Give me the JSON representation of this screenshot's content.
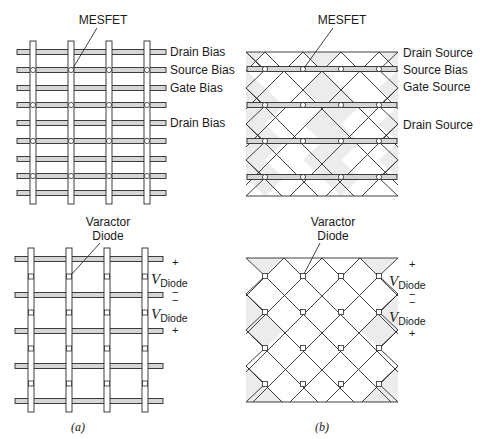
{
  "figure": {
    "panel_a": {
      "caption": "(a)",
      "top": {
        "callout": "MESFET",
        "row_labels": [
          {
            "row": 0,
            "text": "Drain Bias"
          },
          {
            "row": 1,
            "text": "Source Bias"
          },
          {
            "row": 2,
            "text": "Gate Bias"
          },
          {
            "row": 4,
            "text": "Drain Bias"
          }
        ]
      },
      "bottom": {
        "callout_line1": "Varactor",
        "callout_line2": "Diode",
        "polarity": {
          "plus_top": "+",
          "v1": "V",
          "v1_sub": "Diode",
          "minus1": "−",
          "minus2": "−",
          "v2": "V",
          "v2_sub": "Diode",
          "plus_bottom": "+"
        }
      }
    },
    "panel_b": {
      "caption": "(b)",
      "top": {
        "callout": "MESFET",
        "row_labels": [
          {
            "text": "Drain Source"
          },
          {
            "text": "Source Bias"
          },
          {
            "text": "Gate Source"
          },
          {
            "text": "Drain Source"
          }
        ]
      },
      "bottom": {
        "callout_line1": "Varactor",
        "callout_line2": "Diode",
        "polarity": {
          "plus_top": "+",
          "v1": "V",
          "v1_sub": "Diode",
          "minus1": "−",
          "minus2": "−",
          "v2": "V",
          "v2_sub": "Diode",
          "plus_bottom": "+"
        }
      }
    },
    "colors": {
      "stroke": "#2a2a2a",
      "bar_fill": "#d6d6d6",
      "shade_fill": "#ececec",
      "background": "#ffffff"
    }
  }
}
